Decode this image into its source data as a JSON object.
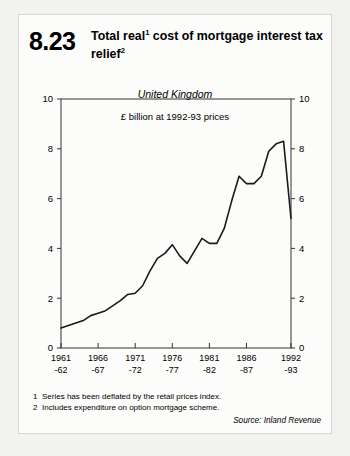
{
  "page": {
    "background": "#f2f2f0",
    "card_background": "#fcfcfb"
  },
  "header": {
    "plate_number": "8.23",
    "title_line1": "Total real",
    "title_sup1": "1",
    "title_line1b": " cost of mortgage interest",
    "title_line2": "tax relief",
    "title_sup2": "2"
  },
  "notes": {
    "note1_num": "1",
    "note1_text": "Series has been deflated by the retail prices index.",
    "note2_num": "2",
    "note2_text": "Includes expenditure on option mortgage scheme.",
    "source": "Source: Inland Revenue"
  },
  "chart_data": {
    "type": "line",
    "subtitle": "United Kingdom",
    "annotation": "£ billion at 1992-93 prices",
    "xlabel": "",
    "ylabel": "",
    "ylim": [
      0,
      10
    ],
    "yticks": [
      0,
      2,
      4,
      6,
      8,
      10
    ],
    "ytick_labels": [
      "0",
      "2",
      "4",
      "6",
      "8",
      "10"
    ],
    "left_axis_labels": [
      "0",
      "2",
      "4",
      "6",
      "8",
      "10"
    ],
    "right_axis_labels": [
      "0",
      "2",
      "4",
      "6",
      "8",
      "10"
    ],
    "grid": false,
    "legend": "none",
    "line_color": "#1a1a1a",
    "xtick_labels": [
      {
        "top": "1961",
        "bottom": "-62"
      },
      {
        "top": "1966",
        "bottom": "-67"
      },
      {
        "top": "1971",
        "bottom": "-72"
      },
      {
        "top": "1976",
        "bottom": "-77"
      },
      {
        "top": "1981",
        "bottom": "-82"
      },
      {
        "top": "1986",
        "bottom": "-87"
      },
      {
        "top": "1992",
        "bottom": "-93"
      }
    ],
    "xtick_positions": [
      0,
      5,
      10,
      15,
      20,
      25,
      31
    ],
    "x": [
      "1961-62",
      "1962-63",
      "1963-64",
      "1964-65",
      "1965-66",
      "1966-67",
      "1967-68",
      "1968-69",
      "1969-70",
      "1970-71",
      "1971-72",
      "1972-73",
      "1973-74",
      "1974-75",
      "1975-76",
      "1976-77",
      "1977-78",
      "1978-79",
      "1979-80",
      "1980-81",
      "1981-82",
      "1982-83",
      "1983-84",
      "1984-85",
      "1985-86",
      "1986-87",
      "1987-88",
      "1988-89",
      "1989-90",
      "1990-91",
      "1991-92",
      "1992-93"
    ],
    "series": [
      {
        "name": "Total real cost of mortgage interest tax relief",
        "values": [
          0.8,
          0.9,
          1.0,
          1.1,
          1.3,
          1.4,
          1.5,
          1.7,
          1.9,
          2.15,
          2.2,
          2.5,
          3.1,
          3.6,
          3.8,
          4.15,
          3.7,
          3.4,
          3.9,
          4.4,
          4.2,
          4.2,
          4.8,
          5.9,
          6.9,
          6.6,
          6.6,
          6.9,
          7.9,
          8.2,
          8.3,
          5.2
        ]
      }
    ]
  }
}
